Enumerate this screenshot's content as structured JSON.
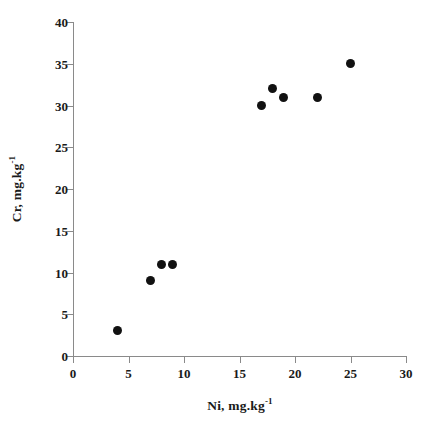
{
  "chart_data": {
    "type": "scatter",
    "title": "",
    "xlabel": "Ni, mg.kg-1",
    "ylabel": "Cr, mg.kg-1",
    "xlabel_base": "Ni, mg.kg",
    "xlabel_exponent": "-1",
    "ylabel_base": "Cr, mg.kg",
    "ylabel_exponent": "-1",
    "xlim": [
      0,
      30
    ],
    "ylim": [
      0,
      40
    ],
    "xticks": [
      0,
      5,
      10,
      15,
      20,
      25,
      30
    ],
    "yticks": [
      0,
      5,
      10,
      15,
      20,
      25,
      30,
      35,
      40
    ],
    "xtick_labels": [
      "0",
      "5",
      "10",
      "15",
      "20",
      "25",
      "30"
    ],
    "ytick_labels": [
      "0",
      "5",
      "10",
      "15",
      "20",
      "25",
      "30",
      "35",
      "40"
    ],
    "grid": false,
    "legend": null,
    "marker_color": "#111111",
    "axis_color": "#8a8a8a",
    "series": [
      {
        "name": "Cr vs Ni",
        "points": [
          {
            "x": 4,
            "y": 3
          },
          {
            "x": 7,
            "y": 9
          },
          {
            "x": 8,
            "y": 11
          },
          {
            "x": 9,
            "y": 11
          },
          {
            "x": 17,
            "y": 30
          },
          {
            "x": 18,
            "y": 32
          },
          {
            "x": 19,
            "y": 31
          },
          {
            "x": 22,
            "y": 31
          },
          {
            "x": 25,
            "y": 35
          }
        ]
      }
    ]
  },
  "caption": {
    "partial_text": ""
  }
}
